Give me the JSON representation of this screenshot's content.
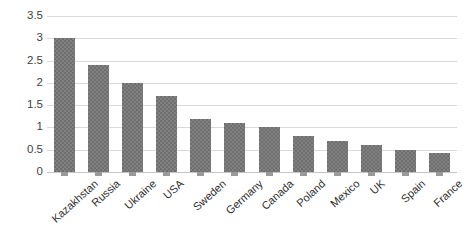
{
  "chart_data": {
    "type": "bar",
    "title": "",
    "subtitle": "",
    "xlabel": "",
    "ylabel": "",
    "categories": [
      "Kazakhstan",
      "Russia",
      "Ukraine",
      "USA",
      "Sweden",
      "Germany",
      "Canada",
      "Poland",
      "Mexico",
      "UK",
      "Spain",
      "France"
    ],
    "values": [
      3.0,
      2.4,
      2.0,
      1.7,
      1.2,
      1.1,
      1.0,
      0.8,
      0.7,
      0.6,
      0.5,
      0.42
    ],
    "ylim": [
      0,
      3.5
    ],
    "yticks": [
      "0",
      "0.5",
      "1",
      "1.5",
      "2",
      "2.5",
      "3",
      "3.5"
    ],
    "ytick_values": [
      0,
      0.5,
      1,
      1.5,
      2,
      2.5,
      3,
      3.5
    ],
    "grid": true,
    "legend": false,
    "legend_position": "none",
    "bar_color": "#6e6e6e",
    "gridline_color": "#d9d9d9",
    "axis_color": "#c4c4c4",
    "label_rotation": -42
  }
}
